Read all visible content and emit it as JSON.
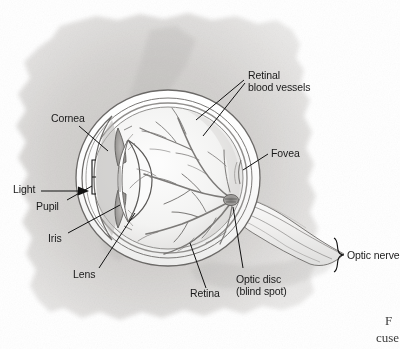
{
  "figure": {
    "kind": "anatomical-illustration",
    "style": "pencil-shaded textbook drawing on torn-paper background",
    "background_color": "#ffffff",
    "blob_color": "#d6d4d2",
    "ink_color": "#4a4a4a",
    "label_color": "#1a1a1a"
  },
  "labels": {
    "cornea": "Cornea",
    "light": "Light",
    "pupil": "Pupil",
    "iris": "Iris",
    "lens": "Lens",
    "retinal_blood_vessels_line1": "Retinal",
    "retinal_blood_vessels_line2": "blood vessels",
    "fovea": "Fovea",
    "optic_nerve": "Optic nerve",
    "retina": "Retina",
    "optic_disc_line1": "Optic disc",
    "optic_disc_line2": "(blind spot)"
  },
  "caption": {
    "line1": "F",
    "line2": "cuse"
  }
}
